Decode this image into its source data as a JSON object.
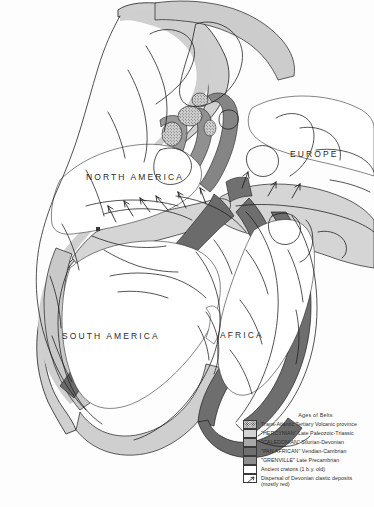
{
  "figure": {
    "type": "geologic-paleogeographic-map"
  },
  "map": {
    "continent_labels": [
      {
        "id": "north-america",
        "text": "NORTH  AMERICA"
      },
      {
        "id": "south-america",
        "text": "SOUTH  AMERICA"
      },
      {
        "id": "africa",
        "text": "AFRICA"
      },
      {
        "id": "europe",
        "text": "EUROPE"
      }
    ]
  },
  "legend": {
    "title": "Ages of Belts",
    "items": [
      {
        "swatch": "volcanic-stipple",
        "color": "#d8d8d8",
        "label": "Trans-Atlantic Tertiary Volcanic province"
      },
      {
        "swatch": "hercynian",
        "color": "#d3d3d3",
        "label": "\"HERCYNIAN\" Late Paleozoic-Triassic"
      },
      {
        "swatch": "caledonian",
        "color": "#a8a8a8",
        "label": "\"CALEDONIAN\" Silurian-Devonian"
      },
      {
        "swatch": "pan-african",
        "color": "#6f6f6f",
        "label": "\"PAN AFRICAN\" Vendian-Cambrian"
      },
      {
        "swatch": "grenville",
        "color": "#8f8f8f",
        "label": "\"GRENVILLE\" Late Precambrian"
      },
      {
        "swatch": "ancient-craton",
        "color": "#ffffff",
        "label": "Ancient cratons (1 b.y. old)"
      },
      {
        "swatch": "dispersal-arrow",
        "color": "#ffffff",
        "label": "Dispersal of Devonian clastic deposits\n(mostly red)"
      }
    ]
  },
  "colors": {
    "background": "#fdfdfd",
    "outline": "#1f1f1f",
    "hercynian": "#d3d3d3",
    "caledonian": "#a8a8a8",
    "pan_african": "#6f6f6f",
    "grenville": "#8f8f8f",
    "craton": "#ffffff"
  }
}
